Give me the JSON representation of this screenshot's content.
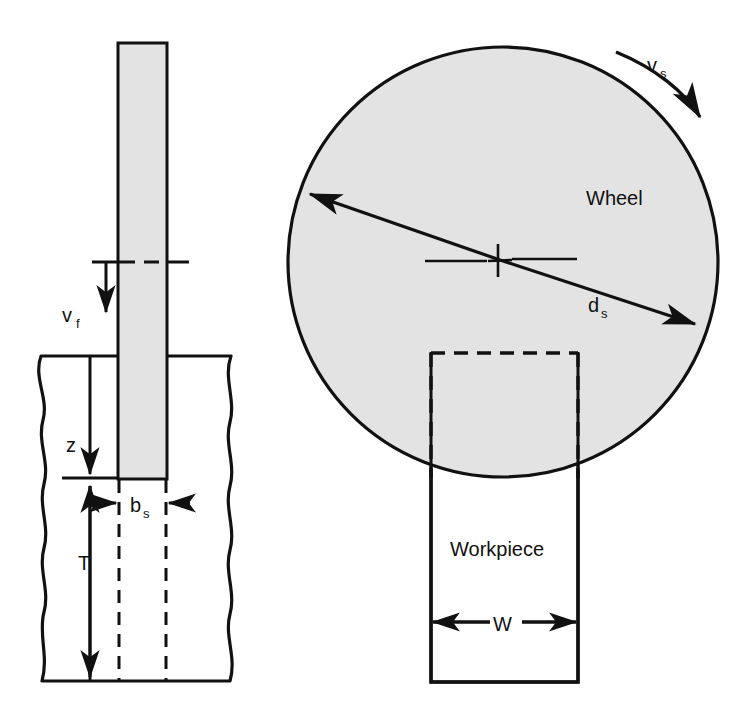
{
  "figure": {
    "type": "engineering-diagram",
    "views": [
      "side-view",
      "plan-view"
    ],
    "colors": {
      "line": "#111111",
      "fill_wheel": "#e3e3e3",
      "fill_blade": "#e3e3e3",
      "background": "#ffffff"
    }
  },
  "side_view": {
    "name": "side-view",
    "blade": {
      "name": "grinding-wheel-edge"
    },
    "workpiece": {
      "name": "workpiece-section"
    },
    "labels": {
      "feed_velocity": "v",
      "feed_velocity_sub": "f",
      "depth": "z",
      "thickness": "T",
      "wheel_width": "b",
      "wheel_width_sub": "s"
    }
  },
  "plan_view": {
    "name": "plan-view",
    "wheel": {
      "name": "grinding-wheel"
    },
    "workpiece": {
      "name": "workpiece"
    },
    "labels": {
      "wheel": "Wheel",
      "workpiece": "Workpiece",
      "surface_speed": "v",
      "surface_speed_sub": "s",
      "diameter": "d",
      "diameter_sub": "s",
      "width": "W"
    }
  }
}
